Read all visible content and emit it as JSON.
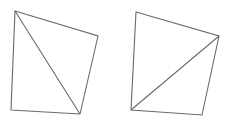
{
  "canvas": {
    "width": 225,
    "height": 118,
    "background": "#ffffff"
  },
  "style": {
    "stroke": "#6a6a6a",
    "stroke_width": 1.1
  },
  "shapes": [
    {
      "name": "quadrilateral-left",
      "vertices": [
        [
          15,
          11
        ],
        [
          98,
          36
        ],
        [
          80,
          114
        ],
        [
          11,
          110
        ]
      ],
      "diagonal": [
        [
          15,
          11
        ],
        [
          80,
          114
        ]
      ]
    },
    {
      "name": "quadrilateral-right",
      "vertices": [
        [
          136,
          12
        ],
        [
          219,
          36
        ],
        [
          202,
          115
        ],
        [
          131,
          110
        ]
      ],
      "diagonal": [
        [
          131,
          110
        ],
        [
          219,
          36
        ]
      ]
    }
  ]
}
